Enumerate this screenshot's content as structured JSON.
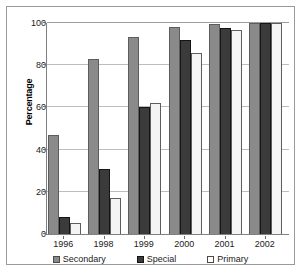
{
  "chart_data": {
    "type": "bar",
    "title": "",
    "xlabel": "",
    "ylabel": "Percentage",
    "ylim": [
      0,
      100
    ],
    "yticks": [
      0,
      20,
      40,
      60,
      80,
      100
    ],
    "grid": true,
    "legend_position": "bottom",
    "categories": [
      "1996",
      "1998",
      "1999",
      "2000",
      "2001",
      "2002"
    ],
    "series": [
      {
        "name": "Secondary",
        "color": "#8a8a8a",
        "values": [
          47,
          83,
          93.5,
          98,
          99.5,
          100
        ]
      },
      {
        "name": "Special",
        "color": "#3b3b3b",
        "values": [
          8,
          31,
          60,
          92,
          97.5,
          100
        ]
      },
      {
        "name": "Primary",
        "color": "#f4f4f4",
        "values": [
          5,
          17,
          62,
          86,
          96.5,
          100
        ]
      }
    ]
  }
}
